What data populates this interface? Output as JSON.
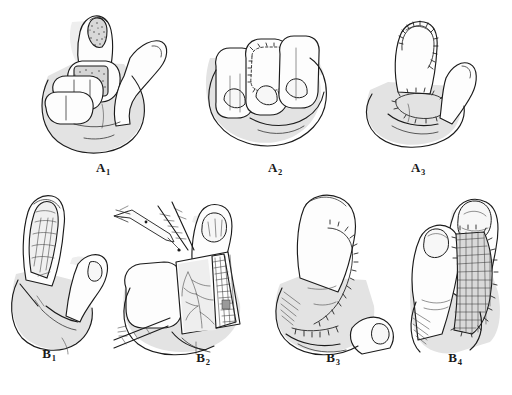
{
  "figure": {
    "background_color": "#ffffff",
    "ink_color": "#1b1b1b",
    "shade_color": "#e3e3e3",
    "rows": 2,
    "panel_count": 7
  },
  "panels": [
    {
      "id": "A1",
      "label_letter": "A",
      "label_index": "1",
      "row": 1,
      "column": 1,
      "caption": "A",
      "description": "Hand with index finger extended showing stippled soft-tissue defect on the fingertip pulp and a second stippled donor/defect area over the proximal phalanx"
    },
    {
      "id": "A2",
      "label_letter": "A",
      "label_index": "2",
      "row": 1,
      "column": 2,
      "caption": "A",
      "description": "Flexed fingers viewed dorsally with a sutured rectangular flap outline marked on the middle finger"
    },
    {
      "id": "A3",
      "label_letter": "A",
      "label_index": "3",
      "row": 1,
      "column": 3,
      "caption": "A",
      "description": "Finger in profile with suture line along the fingertip and a second sutured closure line at the base"
    },
    {
      "id": "B1",
      "label_letter": "B",
      "label_index": "1",
      "row": 2,
      "column": 1,
      "caption": "B",
      "description": "Finger in profile with an open degloving defect exposing underlying soft tissue detail, thumb adjacent"
    },
    {
      "id": "B2",
      "label_letter": "B",
      "label_index": "2",
      "row": 2,
      "column": 2,
      "caption": "B",
      "description": "Flap elevation stage: rectangular flap raised off the dorsum with forceps and traction sutures, subdermal vessels and cross-hatched undersurface visible"
    },
    {
      "id": "B3",
      "label_letter": "B",
      "label_index": "3",
      "row": 2,
      "column": 3,
      "caption": "B",
      "description": "Flap inset and sutured along the lateral and volar margins of the recipient finger"
    },
    {
      "id": "B4",
      "label_letter": "B",
      "label_index": "4",
      "row": 2,
      "column": 4,
      "caption": "B",
      "description": "Final result with cross-hatched split-thickness skin graft sutured over the donor site between two fingers"
    }
  ]
}
